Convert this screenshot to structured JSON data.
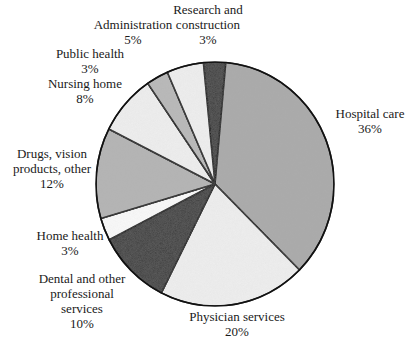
{
  "chart_data": {
    "type": "pie",
    "title": "",
    "start_angle_deg": -5.6,
    "direction": "clockwise",
    "slices": [
      {
        "label": "Research and construction",
        "value": 3,
        "pct_label": "3%",
        "fill": "#3a3a3a"
      },
      {
        "label": "Hospital care",
        "value": 36,
        "pct_label": "36%",
        "fill": "#a9a9a9"
      },
      {
        "label": "Physician services",
        "value": 20,
        "pct_label": "20%",
        "fill": "#efefef"
      },
      {
        "label": "Dental and other professional services",
        "value": 10,
        "pct_label": "10%",
        "fill": "#3a3a3a"
      },
      {
        "label": "Home health",
        "value": 3,
        "pct_label": "3%",
        "fill": "#fafafa"
      },
      {
        "label": "Drugs, vision products, other",
        "value": 12,
        "pct_label": "12%",
        "fill": "#b3b3b3"
      },
      {
        "label": "Nursing home",
        "value": 8,
        "pct_label": "8%",
        "fill": "#efefef"
      },
      {
        "label": "Public health",
        "value": 3,
        "pct_label": "3%",
        "fill": "#b8b8b8"
      },
      {
        "label": "Administration",
        "value": 5,
        "pct_label": "5%",
        "fill": "#efefef"
      }
    ],
    "labels": [
      {
        "lines": [
          "Research and",
          "construction",
          "3%"
        ],
        "x": 208,
        "y": 14
      },
      {
        "lines": [
          "Hospital care",
          "36%"
        ],
        "x": 370,
        "y": 118
      },
      {
        "lines": [
          "Physician services",
          "20%"
        ],
        "x": 237,
        "y": 321
      },
      {
        "lines": [
          "Dental and other",
          "professional",
          "services",
          "10%"
        ],
        "x": 82,
        "y": 283
      },
      {
        "lines": [
          "Home health",
          "3%"
        ],
        "x": 70,
        "y": 240
      },
      {
        "lines": [
          "Drugs, vision",
          "products, other",
          "12%"
        ],
        "x": 52,
        "y": 158
      },
      {
        "lines": [
          "Nursing home",
          "8%"
        ],
        "x": 85,
        "y": 88
      },
      {
        "lines": [
          "Public health",
          "3%"
        ],
        "x": 90,
        "y": 58
      },
      {
        "lines": [
          "Administration",
          "5%"
        ],
        "x": 133,
        "y": 29
      }
    ],
    "geometry": {
      "cx": 215,
      "cy": 184,
      "rx": 119,
      "ry": 122
    },
    "legend": "none (direct labels)"
  }
}
